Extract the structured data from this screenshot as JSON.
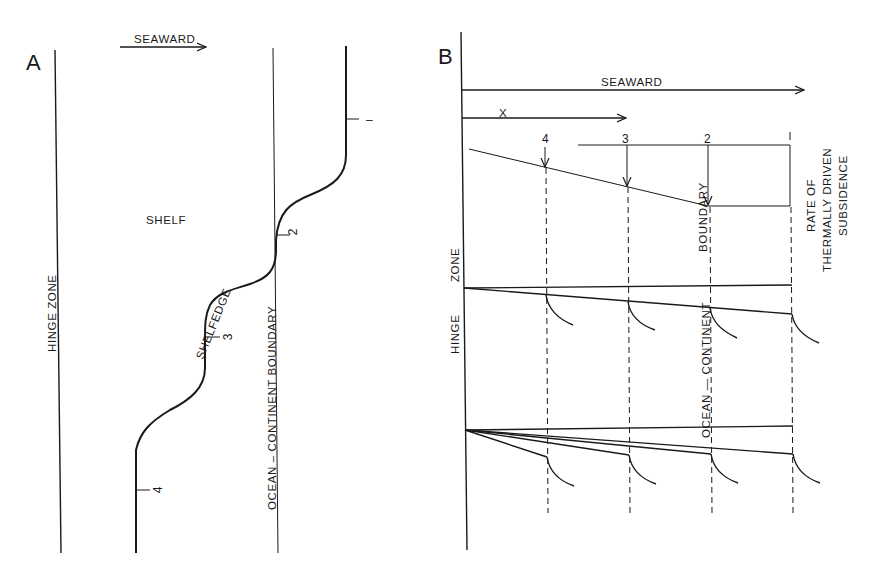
{
  "figure": {
    "panel_a": {
      "letter": "A",
      "seaward_label": "SEAWARD",
      "hinge_zone_label": "HINGE   ZONE",
      "shelf_label": "SHELF",
      "shelfedge_label": "SHELFEDGE",
      "ocb_label": "OCEAN – CONTINENT   BOUNDARY",
      "markers": [
        {
          "label": "2"
        },
        {
          "label": "3"
        },
        {
          "label": "4"
        },
        {
          "label": "–"
        }
      ]
    },
    "panel_b": {
      "letter": "B",
      "seaward_label": "SEAWARD",
      "x_label": "X",
      "column_labels": [
        "4",
        "3",
        "2",
        "1"
      ],
      "rate_label_line1": "RATE   OF",
      "rate_label_line2": "THERMALLY   DRIVEN",
      "rate_label_line3": "SUBSIDENCE",
      "hinge_label": "HINGE",
      "zone_label": "ZONE",
      "ocb_label_lower": "OCEAN  —  CONTINENT",
      "ocb_label_upper": "BOUNDARY"
    }
  },
  "colors": {
    "ink": "#1a1a1a",
    "background": "#ffffff"
  }
}
